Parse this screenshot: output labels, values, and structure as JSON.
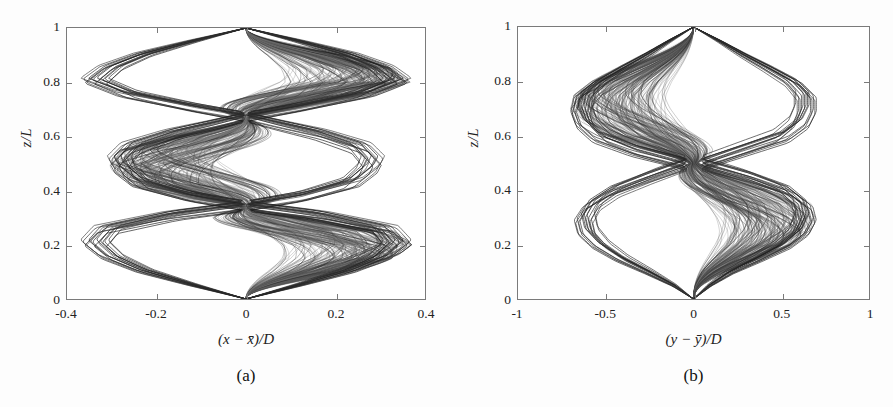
{
  "figure": {
    "background": "#fdfdfd",
    "axis_color": "#7a7a7a",
    "trace_color": "#3a3a3a"
  },
  "panels": [
    {
      "id": "a",
      "caption": "(a)",
      "xlabel": "(x − x̄)/D",
      "ylabel": "z/L",
      "xticks": [
        "-0.4",
        "-0.2",
        "0",
        "0.2",
        "0.4"
      ],
      "yticks": [
        "0",
        "0.2",
        "0.4",
        "0.6",
        "0.8",
        "1"
      ]
    },
    {
      "id": "b",
      "caption": "(b)",
      "xlabel": "(y − ȳ)/D",
      "ylabel": "z/L",
      "xticks": [
        "-1",
        "-0.5",
        "0",
        "0.5",
        "1"
      ],
      "yticks": [
        "0",
        "0.2",
        "0.4",
        "0.6",
        "0.8",
        "1"
      ]
    }
  ],
  "chart_data": [
    {
      "type": "line",
      "panel": "a",
      "title": "",
      "xlabel": "(x − x̄)/D",
      "ylabel": "z/L",
      "xlim": [
        -0.4,
        0.4
      ],
      "ylim": [
        0,
        1
      ],
      "xticks": [
        -0.4,
        -0.2,
        0,
        0.2,
        0.4
      ],
      "yticks": [
        0,
        0.2,
        0.4,
        0.6,
        0.8,
        1
      ],
      "grid": false,
      "legend": "none",
      "description": "Superimposed cross-flow displacement traces of a flexible cylinder; third-mode standing-wave envelope",
      "mode_number": 3,
      "nodes_zL": [
        0.0,
        0.335,
        0.665,
        1.0
      ],
      "antinodes_zL": [
        0.2,
        0.5,
        0.8
      ],
      "envelope_max_amplitude": [
        0.37,
        0.31,
        0.37
      ],
      "envelope_upper": {
        "z": [
          0.0,
          0.05,
          0.1,
          0.15,
          0.2,
          0.25,
          0.3,
          0.335,
          0.37,
          0.42,
          0.47,
          0.5,
          0.55,
          0.6,
          0.635,
          0.665,
          0.7,
          0.75,
          0.8,
          0.85,
          0.9,
          0.95,
          1.0
        ],
        "x": [
          0.0,
          0.13,
          0.25,
          0.33,
          0.37,
          0.34,
          0.18,
          0.0,
          0.14,
          0.26,
          0.3,
          0.31,
          0.28,
          0.18,
          0.08,
          0.0,
          0.13,
          0.29,
          0.37,
          0.33,
          0.25,
          0.13,
          0.0
        ]
      },
      "envelope_lower": {
        "z": [
          0.0,
          0.05,
          0.1,
          0.15,
          0.2,
          0.25,
          0.3,
          0.335,
          0.37,
          0.42,
          0.47,
          0.5,
          0.55,
          0.6,
          0.635,
          0.665,
          0.7,
          0.75,
          0.8,
          0.85,
          0.9,
          0.95,
          1.0
        ],
        "x": [
          0.0,
          -0.13,
          -0.25,
          -0.33,
          -0.37,
          -0.34,
          -0.18,
          0.0,
          -0.14,
          -0.26,
          -0.3,
          -0.31,
          -0.28,
          -0.18,
          -0.08,
          0.0,
          -0.13,
          -0.29,
          -0.37,
          -0.33,
          -0.25,
          -0.13,
          0.0
        ]
      }
    },
    {
      "type": "line",
      "panel": "b",
      "title": "",
      "xlabel": "(y − ȳ)/D",
      "ylabel": "z/L",
      "xlim": [
        -1,
        1
      ],
      "ylim": [
        0,
        1
      ],
      "xticks": [
        -1,
        -0.5,
        0,
        0.5,
        1
      ],
      "yticks": [
        0,
        0.2,
        0.4,
        0.6,
        0.8,
        1
      ],
      "grid": false,
      "legend": "none",
      "description": "Superimposed in-line displacement traces of a flexible cylinder; second-mode standing-wave envelope with skewed lobes",
      "mode_number": 2,
      "nodes_zL": [
        0.0,
        0.5,
        1.0
      ],
      "antinodes_zL": [
        0.27,
        0.76
      ],
      "envelope_max_amplitude": [
        0.7,
        0.7
      ],
      "envelope_upper": {
        "z": [
          0.0,
          0.05,
          0.1,
          0.15,
          0.2,
          0.25,
          0.3,
          0.35,
          0.4,
          0.45,
          0.5,
          0.55,
          0.6,
          0.65,
          0.7,
          0.75,
          0.8,
          0.85,
          0.9,
          0.95,
          1.0
        ],
        "x": [
          0.0,
          0.1,
          0.23,
          0.4,
          0.56,
          0.66,
          0.7,
          0.68,
          0.58,
          0.35,
          0.05,
          0.3,
          0.55,
          0.66,
          0.7,
          0.7,
          0.62,
          0.47,
          0.31,
          0.16,
          0.0
        ]
      },
      "envelope_lower": {
        "z": [
          0.0,
          0.05,
          0.1,
          0.15,
          0.2,
          0.25,
          0.3,
          0.35,
          0.4,
          0.45,
          0.5,
          0.55,
          0.6,
          0.65,
          0.7,
          0.75,
          0.8,
          0.85,
          0.9,
          0.95,
          1.0
        ],
        "x": [
          0.0,
          -0.12,
          -0.28,
          -0.45,
          -0.58,
          -0.66,
          -0.68,
          -0.63,
          -0.5,
          -0.28,
          -0.04,
          -0.36,
          -0.58,
          -0.67,
          -0.7,
          -0.68,
          -0.58,
          -0.44,
          -0.29,
          -0.15,
          0.0
        ]
      }
    }
  ]
}
